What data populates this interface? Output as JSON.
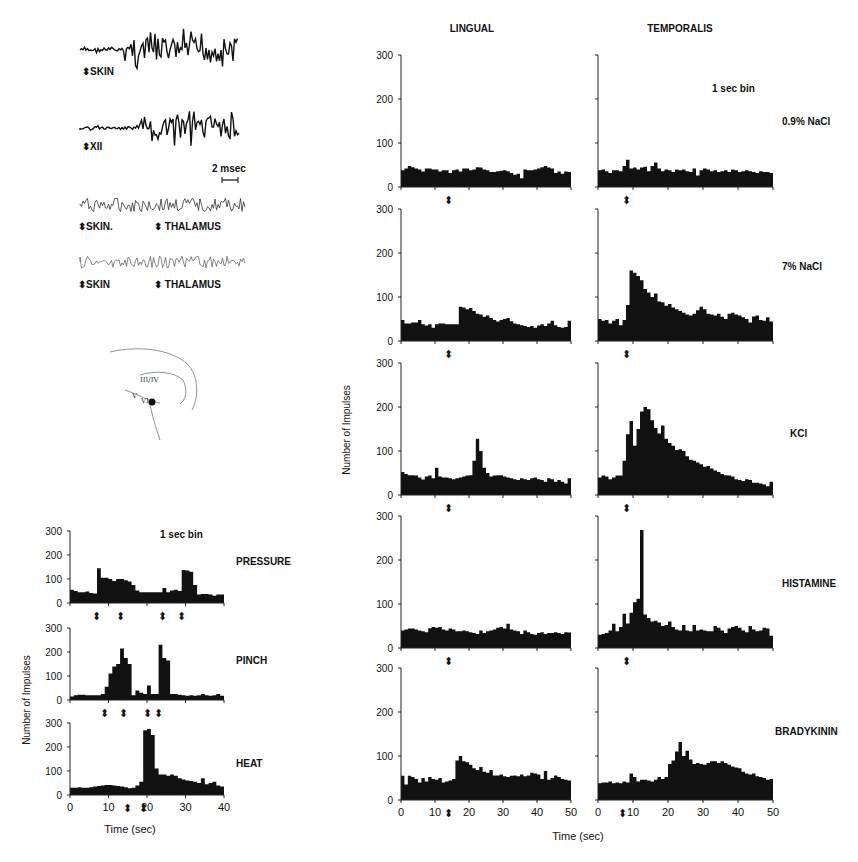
{
  "figure": {
    "traces": {
      "scale_bar_label": "2 msec",
      "rows": [
        {
          "left_label": "SKIN",
          "right_label": ""
        },
        {
          "left_label": "XII",
          "right_label": ""
        },
        {
          "left_label": "SKIN.",
          "right_label": "THALAMUS"
        },
        {
          "left_label": "SKIN",
          "right_label": "THALAMUS"
        }
      ]
    },
    "brain_sketch": {
      "labels": [
        "III",
        "IV",
        "V",
        "VI",
        "III/IV"
      ]
    },
    "left_panel": {
      "bin_label": "1 sec bin",
      "ylabel": "Number of Impulses",
      "xlabel": "Time (sec)",
      "xticks": [
        "0",
        "10",
        "20",
        "30",
        "40"
      ],
      "yticks": [
        "0",
        "100",
        "200",
        "300"
      ]
    },
    "right_panel": {
      "column_titles": [
        "LINGUAL",
        "TEMPORALIS"
      ],
      "bin_label": "1 sec bin",
      "ylabel": "Number of Impulses",
      "xlabel": "Time (sec)",
      "xticks": [
        "0",
        "10",
        "20",
        "30",
        "40",
        "50"
      ],
      "yticks": [
        "0",
        "100",
        "200",
        "300"
      ]
    }
  },
  "chart_data": [
    {
      "type": "bar",
      "title": "Peripheral stimuli (1 sec bin)",
      "xlabel": "Time (sec)",
      "ylabel": "Number of Impulses",
      "xlim": [
        0,
        40
      ],
      "ylim": [
        0,
        300
      ],
      "bin_width": 1,
      "series": [
        {
          "name": "PRESSURE",
          "stimulus_arrows_sec": [
            7,
            13,
            24,
            29
          ],
          "values": [
            55,
            50,
            45,
            45,
            48,
            42,
            40,
            145,
            105,
            105,
            100,
            92,
            100,
            100,
            95,
            90,
            75,
            52,
            45,
            45,
            45,
            45,
            45,
            45,
            62,
            45,
            52,
            55,
            50,
            138,
            135,
            130,
            75,
            35,
            38,
            38,
            35,
            30,
            35,
            35
          ]
        },
        {
          "name": "PINCH",
          "stimulus_arrows_sec": [
            9,
            14,
            20,
            23
          ],
          "values": [
            15,
            20,
            22,
            22,
            20,
            20,
            20,
            20,
            25,
            55,
            110,
            140,
            150,
            215,
            175,
            150,
            20,
            40,
            30,
            25,
            60,
            25,
            25,
            230,
            175,
            165,
            25,
            25,
            22,
            20,
            18,
            20,
            18,
            20,
            25,
            20,
            18,
            20,
            25,
            18
          ]
        },
        {
          "name": "HEAT",
          "stimulus_arrows_sec": [
            15,
            19
          ],
          "values": [
            30,
            30,
            32,
            30,
            30,
            32,
            35,
            38,
            40,
            42,
            42,
            40,
            38,
            36,
            32,
            28,
            30,
            40,
            55,
            270,
            275,
            250,
            110,
            85,
            85,
            80,
            85,
            80,
            70,
            65,
            60,
            58,
            55,
            50,
            70,
            45,
            50,
            55,
            40,
            35
          ]
        }
      ]
    },
    {
      "type": "bar",
      "title": "LINGUAL",
      "xlabel": "Time (sec)",
      "ylabel": "Number of Impulses",
      "xlim": [
        0,
        50
      ],
      "ylim": [
        0,
        300
      ],
      "bin_width": 1,
      "series": [
        {
          "name": "0.9% NaCl",
          "stimulus_arrow_sec": 14,
          "values": [
            38,
            42,
            48,
            45,
            42,
            40,
            35,
            42,
            42,
            40,
            40,
            35,
            38,
            38,
            32,
            38,
            40,
            35,
            42,
            42,
            38,
            40,
            45,
            44,
            40,
            38,
            34,
            34,
            36,
            37,
            38,
            36,
            32,
            28,
            30,
            20,
            40,
            38,
            38,
            40,
            42,
            45,
            48,
            44,
            42,
            32,
            35,
            30,
            35,
            34
          ]
        },
        {
          "name": "7% NaCl",
          "stimulus_arrow_sec": 14,
          "values": [
            48,
            40,
            40,
            42,
            42,
            48,
            38,
            35,
            38,
            30,
            38,
            40,
            40,
            38,
            38,
            38,
            38,
            78,
            76,
            72,
            75,
            68,
            62,
            60,
            55,
            58,
            52,
            48,
            44,
            48,
            50,
            52,
            45,
            40,
            38,
            36,
            34,
            32,
            34,
            30,
            35,
            38,
            34,
            40,
            46,
            36,
            32,
            30,
            32,
            46
          ]
        },
        {
          "name": "KCl",
          "stimulus_arrow_sec": 14,
          "values": [
            52,
            48,
            45,
            45,
            44,
            40,
            35,
            42,
            44,
            38,
            62,
            42,
            40,
            40,
            38,
            36,
            38,
            40,
            42,
            44,
            45,
            78,
            128,
            100,
            62,
            50,
            42,
            44,
            45,
            45,
            42,
            40,
            38,
            36,
            34,
            38,
            36,
            34,
            38,
            40,
            36,
            34,
            30,
            38,
            36,
            30,
            34,
            30,
            26,
            38
          ]
        },
        {
          "name": "HISTAMINE",
          "stimulus_arrow_sec": 14,
          "values": [
            40,
            42,
            44,
            44,
            42,
            40,
            38,
            36,
            45,
            48,
            46,
            48,
            42,
            40,
            44,
            42,
            38,
            38,
            40,
            38,
            36,
            34,
            32,
            40,
            34,
            38,
            40,
            42,
            46,
            48,
            44,
            55,
            42,
            40,
            38,
            32,
            40,
            36,
            32,
            30,
            34,
            36,
            32,
            34,
            34,
            36,
            34,
            32,
            36,
            35
          ]
        },
        {
          "name": "BRADYKININ",
          "stimulus_arrow_sec": 14,
          "values": [
            55,
            35,
            55,
            52,
            48,
            40,
            50,
            42,
            52,
            48,
            46,
            50,
            40,
            42,
            44,
            48,
            90,
            100,
            88,
            86,
            80,
            72,
            68,
            75,
            64,
            62,
            68,
            56,
            56,
            58,
            54,
            52,
            55,
            56,
            54,
            58,
            54,
            56,
            62,
            60,
            58,
            48,
            66,
            46,
            50,
            56,
            52,
            48,
            46,
            44
          ]
        }
      ]
    },
    {
      "type": "bar",
      "title": "TEMPORALIS",
      "xlabel": "Time (sec)",
      "ylabel": "Number of Impulses",
      "xlim": [
        0,
        50
      ],
      "ylim": [
        0,
        300
      ],
      "bin_width": 1,
      "series": [
        {
          "name": "0.9% NaCl",
          "stimulus_arrow_sec": 8,
          "values": [
            38,
            40,
            36,
            32,
            38,
            38,
            36,
            48,
            62,
            42,
            44,
            40,
            44,
            46,
            36,
            48,
            56,
            42,
            36,
            40,
            38,
            34,
            40,
            38,
            40,
            36,
            34,
            42,
            26,
            38,
            42,
            40,
            36,
            38,
            34,
            36,
            38,
            34,
            40,
            38,
            34,
            36,
            38,
            36,
            34,
            32,
            36,
            34,
            34,
            32
          ]
        },
        {
          "name": "7% NaCl",
          "stimulus_arrow_sec": 8,
          "values": [
            50,
            46,
            48,
            40,
            46,
            50,
            36,
            48,
            82,
            160,
            155,
            148,
            138,
            118,
            110,
            100,
            108,
            90,
            88,
            80,
            84,
            76,
            72,
            68,
            64,
            60,
            58,
            62,
            70,
            78,
            72,
            62,
            60,
            58,
            62,
            55,
            50,
            62,
            64,
            60,
            58,
            54,
            50,
            42,
            56,
            58,
            48,
            46,
            54,
            44
          ]
        },
        {
          "name": "KCl",
          "stimulus_arrow_sec": 8,
          "values": [
            40,
            44,
            42,
            36,
            40,
            44,
            44,
            78,
            138,
            168,
            112,
            150,
            190,
            200,
            195,
            170,
            152,
            140,
            158,
            128,
            118,
            112,
            102,
            104,
            100,
            88,
            80,
            78,
            74,
            70,
            64,
            66,
            60,
            56,
            52,
            48,
            45,
            44,
            42,
            36,
            34,
            32,
            36,
            34,
            28,
            28,
            26,
            24,
            20,
            30
          ]
        },
        {
          "name": "HISTAMINE",
          "stimulus_arrow_sec": 8,
          "values": [
            30,
            32,
            34,
            40,
            55,
            38,
            48,
            78,
            56,
            80,
            104,
            112,
            268,
            76,
            68,
            60,
            62,
            58,
            50,
            52,
            60,
            48,
            42,
            40,
            52,
            40,
            38,
            52,
            40,
            42,
            40,
            38,
            38,
            50,
            46,
            40,
            34,
            44,
            48,
            50,
            46,
            40,
            36,
            50,
            42,
            38,
            40,
            46,
            44,
            28
          ]
        },
        {
          "name": "BRADYKININ",
          "stimulus_arrow_sec": 7,
          "values": [
            38,
            40,
            40,
            42,
            38,
            40,
            38,
            42,
            40,
            60,
            52,
            42,
            46,
            46,
            44,
            42,
            46,
            52,
            48,
            52,
            82,
            90,
            110,
            132,
            100,
            112,
            92,
            82,
            84,
            82,
            80,
            84,
            88,
            88,
            84,
            88,
            84,
            80,
            76,
            74,
            72,
            64,
            60,
            58,
            60,
            54,
            52,
            50,
            46,
            48
          ]
        }
      ]
    }
  ]
}
